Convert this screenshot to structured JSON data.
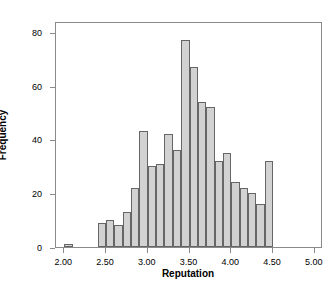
{
  "chart_data": {
    "type": "bar",
    "title": "",
    "xlabel": "Reputation",
    "ylabel": "Frequency",
    "xlim": [
      1.9,
      5.1
    ],
    "ylim": [
      0,
      84
    ],
    "grid": false,
    "legend": null,
    "bin_width": 0.1,
    "xticks": [
      2.0,
      2.5,
      3.0,
      3.5,
      4.0,
      4.5,
      5.0
    ],
    "xtick_labels": [
      "2.00",
      "2.50",
      "3.00",
      "3.50",
      "4.00",
      "4.50",
      "5.00"
    ],
    "yticks": [
      0,
      20,
      40,
      60,
      80
    ],
    "ytick_labels": [
      "0",
      "20",
      "40",
      "60",
      "80"
    ],
    "bar_fill": "#d2d2d2",
    "bar_edge": "#666666",
    "axis_color": "#8a8a8a",
    "bins": [
      {
        "left": 2.0,
        "right": 2.1,
        "center": 2.05,
        "value": 1
      },
      {
        "left": 2.4,
        "right": 2.5,
        "center": 2.45,
        "value": 9
      },
      {
        "left": 2.5,
        "right": 2.6,
        "center": 2.55,
        "value": 10
      },
      {
        "left": 2.6,
        "right": 2.7,
        "center": 2.65,
        "value": 8
      },
      {
        "left": 2.7,
        "right": 2.8,
        "center": 2.75,
        "value": 13
      },
      {
        "left": 2.8,
        "right": 2.9,
        "center": 2.85,
        "value": 22
      },
      {
        "left": 2.9,
        "right": 3.0,
        "center": 2.95,
        "value": 43
      },
      {
        "left": 3.0,
        "right": 3.1,
        "center": 3.05,
        "value": 30
      },
      {
        "left": 3.1,
        "right": 3.2,
        "center": 3.15,
        "value": 31
      },
      {
        "left": 3.2,
        "right": 3.3,
        "center": 3.25,
        "value": 42
      },
      {
        "left": 3.3,
        "right": 3.4,
        "center": 3.35,
        "value": 36
      },
      {
        "left": 3.4,
        "right": 3.5,
        "center": 3.45,
        "value": 77
      },
      {
        "left": 3.5,
        "right": 3.6,
        "center": 3.55,
        "value": 67
      },
      {
        "left": 3.6,
        "right": 3.7,
        "center": 3.65,
        "value": 54
      },
      {
        "left": 3.7,
        "right": 3.8,
        "center": 3.75,
        "value": 52
      },
      {
        "left": 3.8,
        "right": 3.9,
        "center": 3.85,
        "value": 32
      },
      {
        "left": 3.9,
        "right": 4.0,
        "center": 3.95,
        "value": 35
      },
      {
        "left": 4.0,
        "right": 4.1,
        "center": 4.05,
        "value": 24
      },
      {
        "left": 4.1,
        "right": 4.2,
        "center": 4.15,
        "value": 22
      },
      {
        "left": 4.2,
        "right": 4.3,
        "center": 4.25,
        "value": 20
      },
      {
        "left": 4.3,
        "right": 4.4,
        "center": 4.35,
        "value": 16
      },
      {
        "left": 4.4,
        "right": 4.5,
        "center": 4.45,
        "value": 32
      }
    ],
    "categories": [
      "2.05",
      "2.45",
      "2.55",
      "2.65",
      "2.75",
      "2.85",
      "2.95",
      "3.05",
      "3.15",
      "3.25",
      "3.35",
      "3.45",
      "3.55",
      "3.65",
      "3.75",
      "3.85",
      "3.95",
      "4.05",
      "4.15",
      "4.25",
      "4.35",
      "4.45"
    ],
    "values": [
      1,
      9,
      10,
      8,
      13,
      22,
      43,
      30,
      31,
      42,
      36,
      77,
      67,
      54,
      52,
      32,
      35,
      24,
      22,
      20,
      16,
      32
    ]
  }
}
